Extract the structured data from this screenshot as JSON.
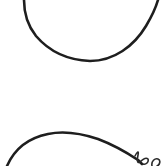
{
  "image": {
    "description": "Fragment of a hand-drawn line sketch on white paper",
    "background_color": "#ffffff",
    "ink_color": "#1e1e1e",
    "strokes": [
      {
        "name": "upper-u-curve",
        "shape": "U-shaped arc opening upward"
      },
      {
        "name": "lower-arch-curve",
        "shape": "arch opening downward"
      },
      {
        "name": "squiggle",
        "shape": "small cursive loop at lower right"
      }
    ]
  }
}
